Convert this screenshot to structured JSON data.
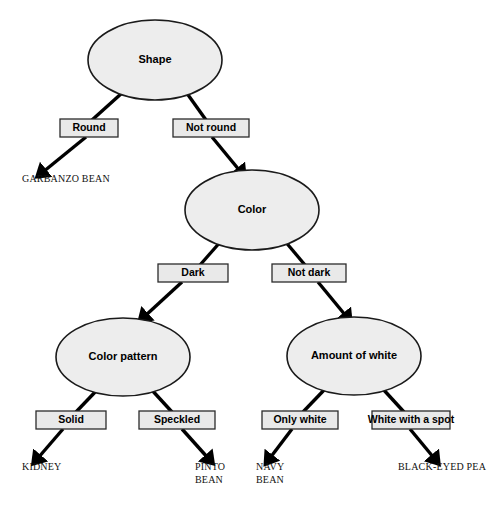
{
  "diagram": {
    "background_color": "#ffffff",
    "node_fill": "#ededed",
    "node_stroke": "#1a1a1a",
    "box_fill": "#e9e9e9",
    "box_stroke": "#2b2b2b",
    "edge_color": "#000000"
  },
  "nodes": [
    {
      "id": "shape",
      "label": "Shape",
      "cx": 155,
      "cy": 60,
      "rx": 67,
      "ry": 40
    },
    {
      "id": "color",
      "label": "Color",
      "cx": 252,
      "cy": 210,
      "rx": 67,
      "ry": 40
    },
    {
      "id": "color_pattern",
      "label": "Color pattern",
      "cx": 123,
      "cy": 357,
      "rx": 67,
      "ry": 39
    },
    {
      "id": "amount_white",
      "label": "Amount of white",
      "cx": 354,
      "cy": 356,
      "rx": 67,
      "ry": 39
    }
  ],
  "branches": [
    {
      "id": "round",
      "label": "Round",
      "x": 60,
      "y": 119,
      "w": 58,
      "h": 18
    },
    {
      "id": "not_round",
      "label": "Not round",
      "x": 173,
      "y": 119,
      "w": 76,
      "h": 18
    },
    {
      "id": "dark",
      "label": "Dark",
      "x": 158,
      "y": 264,
      "w": 70,
      "h": 18
    },
    {
      "id": "not_dark",
      "label": "Not dark",
      "x": 272,
      "y": 264,
      "w": 74,
      "h": 18
    },
    {
      "id": "solid",
      "label": "Solid",
      "x": 36,
      "y": 411,
      "w": 70,
      "h": 18
    },
    {
      "id": "speckled",
      "label": "Speckled",
      "x": 139,
      "y": 411,
      "w": 76,
      "h": 18
    },
    {
      "id": "only_white",
      "label": "Only white",
      "x": 262,
      "y": 411,
      "w": 76,
      "h": 18
    },
    {
      "id": "white_with_spot",
      "label": "White with a spot",
      "x": 372,
      "y": 411,
      "w": 78,
      "h": 18
    }
  ],
  "leaves": [
    {
      "id": "garbanzo_bean",
      "lines": [
        "GARBANZO BEAN"
      ],
      "x": 22,
      "y": 182
    },
    {
      "id": "kidney",
      "lines": [
        "KIDNEY"
      ],
      "x": 22,
      "y": 470
    },
    {
      "id": "pinto_bean",
      "lines": [
        "PINTO",
        "BEAN"
      ],
      "x": 195,
      "y": 470
    },
    {
      "id": "navy_bean",
      "lines": [
        "NAVY",
        "BEAN"
      ],
      "x": 256,
      "y": 470
    },
    {
      "id": "black_eyed_pea",
      "lines": [
        "BLACK-EYED PEA"
      ],
      "x": 398,
      "y": 470
    }
  ],
  "edges": [
    {
      "id": "shape-to-round",
      "from": "shape",
      "to": "round",
      "x1": 122,
      "y1": 93,
      "x2": 92,
      "y2": 120,
      "arrow": false
    },
    {
      "id": "round-to-garbanzo",
      "from": "round",
      "to": "garbanzo_bean",
      "x1": 86,
      "y1": 137,
      "x2": 43,
      "y2": 172,
      "arrow": true
    },
    {
      "id": "shape-to-notround",
      "from": "shape",
      "to": "not_round",
      "x1": 186,
      "y1": 92,
      "x2": 206,
      "y2": 120,
      "arrow": false
    },
    {
      "id": "notround-to-color",
      "from": "not_round",
      "to": "color",
      "x1": 212,
      "y1": 137,
      "x2": 240,
      "y2": 171,
      "arrow": true
    },
    {
      "id": "color-to-dark",
      "from": "color",
      "to": "dark",
      "x1": 222,
      "y1": 240,
      "x2": 200,
      "y2": 265,
      "arrow": false
    },
    {
      "id": "dark-to-colorpattern",
      "from": "dark",
      "to": "color_pattern",
      "x1": 182,
      "y1": 282,
      "x2": 145,
      "y2": 316,
      "arrow": true
    },
    {
      "id": "color-to-notdark",
      "from": "color",
      "to": "not_dark",
      "x1": 284,
      "y1": 240,
      "x2": 305,
      "y2": 265,
      "arrow": false
    },
    {
      "id": "notdark-to-amountwhite",
      "from": "not_dark",
      "to": "amount_white",
      "x1": 318,
      "y1": 282,
      "x2": 346,
      "y2": 316,
      "arrow": true
    },
    {
      "id": "colorpattern-to-solid",
      "from": "color_pattern",
      "to": "solid",
      "x1": 98,
      "y1": 389,
      "x2": 76,
      "y2": 412,
      "arrow": false
    },
    {
      "id": "solid-to-kidney",
      "from": "solid",
      "to": "kidney",
      "x1": 63,
      "y1": 429,
      "x2": 38,
      "y2": 458,
      "arrow": true
    },
    {
      "id": "colorpattern-to-speckled",
      "from": "color_pattern",
      "to": "speckled",
      "x1": 150,
      "y1": 388,
      "x2": 172,
      "y2": 412,
      "arrow": false
    },
    {
      "id": "speckled-to-pinto",
      "from": "speckled",
      "to": "pinto_bean",
      "x1": 182,
      "y1": 429,
      "x2": 208,
      "y2": 458,
      "arrow": true
    },
    {
      "id": "amountwhite-to-onlywhite",
      "from": "amount_white",
      "to": "only_white",
      "x1": 326,
      "y1": 388,
      "x2": 303,
      "y2": 412,
      "arrow": false
    },
    {
      "id": "onlywhite-to-navy",
      "from": "only_white",
      "to": "navy_bean",
      "x1": 292,
      "y1": 429,
      "x2": 270,
      "y2": 458,
      "arrow": true
    },
    {
      "id": "amountwhite-to-whitespot",
      "from": "amount_white",
      "to": "white_with_spot",
      "x1": 382,
      "y1": 388,
      "x2": 404,
      "y2": 412,
      "arrow": false
    },
    {
      "id": "whitespot-to-blackeyed",
      "from": "white_with_spot",
      "to": "black_eyed_pea",
      "x1": 410,
      "y1": 429,
      "x2": 434,
      "y2": 458,
      "arrow": true
    }
  ]
}
